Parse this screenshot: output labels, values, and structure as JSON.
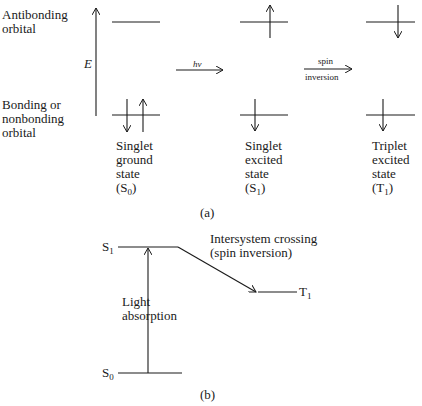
{
  "part_a": {
    "caption": "(a)",
    "axis_label": "E",
    "orbital_labels": {
      "antibonding": "Antibonding\norbital",
      "bonding": "Bonding or\nnonbonding\norbital"
    },
    "transitions": {
      "excitation_label": "hν",
      "spin_label_top": "spin",
      "spin_label_bottom": "inversion"
    },
    "states": [
      {
        "line1": "Singlet",
        "line2": "ground",
        "line3": "state",
        "symbol": "S",
        "subscript": "0"
      },
      {
        "line1": "Singlet",
        "line2": "excited",
        "line3": "state",
        "symbol": "S",
        "subscript": "1"
      },
      {
        "line1": "Triplet",
        "line2": "excited",
        "line3": "state",
        "symbol": "T",
        "subscript": "1"
      }
    ]
  },
  "part_b": {
    "caption": "(b)",
    "levels": {
      "s1": {
        "symbol": "S",
        "subscript": "1"
      },
      "s0": {
        "symbol": "S",
        "subscript": "0"
      },
      "t1": {
        "symbol": "T",
        "subscript": "1"
      }
    },
    "absorption_label": "Light\nabsorption",
    "isc_label": "Intersystem crossing\n(spin inversion)"
  },
  "colors": {
    "ink": "#1a1a1a",
    "background": "#ffffff"
  }
}
